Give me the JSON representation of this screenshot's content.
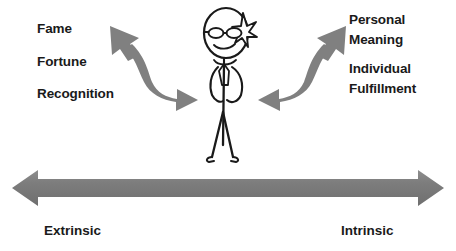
{
  "diagram": {
    "background_color": "#ffffff",
    "text_color": "#1a1a1a",
    "arrow_color": "#808080",
    "figure_color": "#1a1a1a"
  },
  "extrinsic": {
    "terms": [
      {
        "text": "Fame"
      },
      {
        "text": "Fortune"
      },
      {
        "text": "Recognition"
      }
    ],
    "axis_label": "Extrinsic"
  },
  "intrinsic": {
    "term_pairs": [
      {
        "line1": "Personal",
        "line2": "Meaning"
      },
      {
        "line1": "Individual",
        "line2": "Fulfillment"
      }
    ],
    "axis_label": "Intrinsic"
  },
  "figure": {
    "icon_name": "stick-figure-person",
    "features": [
      "head",
      "glasses",
      "smile",
      "sparkle-star",
      "necktie",
      "arms-on-hips",
      "legs",
      "feet"
    ]
  },
  "arrows": {
    "left_curved": {
      "icon_name": "curved-double-arrow-left",
      "color": "#808080"
    },
    "right_curved": {
      "icon_name": "curved-double-arrow-right",
      "color": "#808080"
    },
    "horizontal_spectrum": {
      "icon_name": "double-headed-horizontal-arrow",
      "color": "#808080"
    }
  }
}
